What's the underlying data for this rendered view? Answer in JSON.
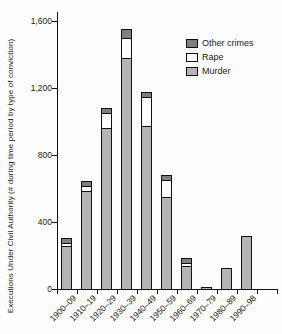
{
  "chart_data": {
    "type": "bar",
    "stacked": true,
    "title": "",
    "xlabel": "",
    "ylabel": "Executions Under Civil Authority (# during time period by type of conviction)",
    "categories": [
      "1900–09",
      "1910–19",
      "1920–29",
      "1930–39",
      "1940–49",
      "1950–59",
      "1960–69",
      "1970–79",
      "1980–89",
      "1990–98"
    ],
    "series": [
      {
        "name": "Murder",
        "color": "#b4b4b4",
        "values": [
          255,
          580,
          950,
          1370,
          965,
          545,
          135,
          5,
          120,
          310
        ]
      },
      {
        "name": "Rape",
        "color": "#ffffff",
        "values": [
          15,
          30,
          90,
          120,
          170,
          100,
          15,
          0,
          0,
          0
        ]
      },
      {
        "name": "Other crimes",
        "color": "#7f7f7f",
        "values": [
          30,
          30,
          30,
          55,
          30,
          30,
          30,
          0,
          0,
          0
        ]
      }
    ],
    "totals": [
      300,
      640,
      1070,
      1545,
      1165,
      675,
      180,
      5,
      120,
      310
    ],
    "ylim": [
      0,
      1600
    ],
    "yticks": [
      0,
      400,
      800,
      1200,
      1600
    ],
    "ytick_labels": [
      "0",
      "400",
      "800",
      "1,200",
      "1,600"
    ],
    "grid": false,
    "legend_position": "upper right",
    "legend": [
      {
        "label": "Other crimes",
        "color": "#7f7f7f"
      },
      {
        "label": "Rape",
        "color": "#ffffff"
      },
      {
        "label": "Murder",
        "color": "#b4b4b4"
      }
    ],
    "axis_color": "#111111"
  }
}
